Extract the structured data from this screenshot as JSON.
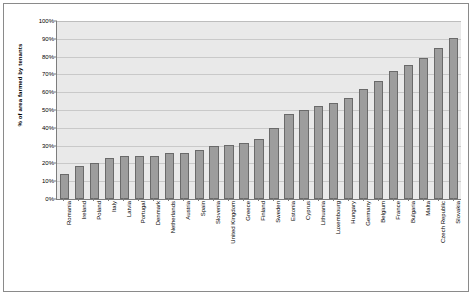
{
  "chart_data": {
    "type": "bar",
    "title": "",
    "subtitle": "",
    "xlabel": "",
    "ylabel": "% of area farmed by tenants",
    "ylim": [
      0,
      100
    ],
    "y_tick_labels": [
      "0%",
      "10%",
      "20%",
      "30%",
      "40%",
      "50%",
      "60%",
      "70%",
      "80%",
      "90%",
      "100%"
    ],
    "y_tick_values": [
      0,
      10,
      20,
      30,
      40,
      50,
      60,
      70,
      80,
      90,
      100
    ],
    "grid": true,
    "legend": false,
    "legend_position": "none",
    "categories": [
      "Romania",
      "Ireland",
      "Poland",
      "Italy",
      "Latvia",
      "Portugal",
      "Denmark",
      "Netherlands",
      "Austria",
      "Spain",
      "Slovenia",
      "United Kingdom",
      "Greece",
      "Finland",
      "Sweden",
      "Estonia",
      "Cyprus",
      "Lithuania",
      "Luxembourg",
      "Hungary",
      "Germany",
      "Belgium",
      "France",
      "Bulgaria",
      "Malta",
      "Czech Republic",
      "Slovakia"
    ],
    "values": [
      14,
      18.5,
      20,
      23,
      24,
      24,
      24,
      26,
      26,
      27.5,
      30,
      30.5,
      31.5,
      33.5,
      40,
      47.5,
      50,
      52.5,
      54,
      56.5,
      62,
      66.5,
      72,
      75.5,
      79,
      85,
      90.5
    ],
    "bar_color": "#9d9d9d",
    "bar_border_color": "#6a6a6a",
    "plot_background": "#e9e9e9",
    "gridline_color": "#c9c9c9",
    "axis_color": "#7d7d7d",
    "frame_color": "#8a8a8a"
  }
}
